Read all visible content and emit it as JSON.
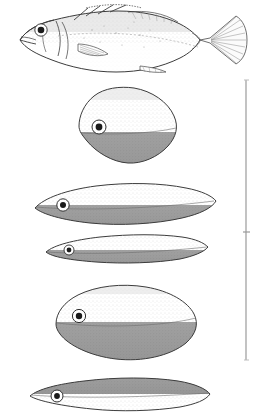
{
  "figure": {
    "type": "scientific-illustration-plate",
    "background_color": "#ffffff",
    "ink_color": "#3a3a3a",
    "shade_color": "#9a9a9a",
    "stipple_color": "#c9c9c9"
  },
  "panels": [
    {
      "id": "lateral-view",
      "name": "fish-lateral-view",
      "label": "",
      "parts": [
        {
          "name": "head",
          "label": ""
        },
        {
          "name": "eye",
          "label": ""
        },
        {
          "name": "mouth",
          "label": ""
        },
        {
          "name": "operculum",
          "label": ""
        },
        {
          "name": "dorsal-fin",
          "label": ""
        },
        {
          "name": "pectoral-fin",
          "label": ""
        },
        {
          "name": "anal-fin",
          "label": ""
        },
        {
          "name": "caudal-fin",
          "label": ""
        },
        {
          "name": "lateral-line",
          "label": ""
        }
      ]
    },
    {
      "id": "section-1",
      "name": "cross-section-rhomboid",
      "label": "",
      "shape": "rhomboid",
      "shading": "ventral",
      "has_eye": true
    },
    {
      "id": "section-2",
      "name": "cross-section-lanceolate-wide",
      "label": "",
      "shape": "lanceolate",
      "shading": "ventral",
      "has_eye": true
    },
    {
      "id": "section-3",
      "name": "cross-section-lanceolate-narrow",
      "label": "",
      "shape": "lanceolate",
      "shading": "ventral",
      "has_eye": true
    },
    {
      "id": "section-4",
      "name": "cross-section-ovate",
      "label": "",
      "shape": "ovate",
      "shading": "ventral",
      "has_eye": true
    },
    {
      "id": "section-5",
      "name": "cross-section-lanceolate-dorsal-shaded",
      "label": "",
      "shape": "lanceolate",
      "shading": "dorsal",
      "has_eye": true
    }
  ],
  "scale_bracket": {
    "name": "scale-bracket",
    "label": "",
    "orientation": "vertical",
    "tick_label": ""
  }
}
